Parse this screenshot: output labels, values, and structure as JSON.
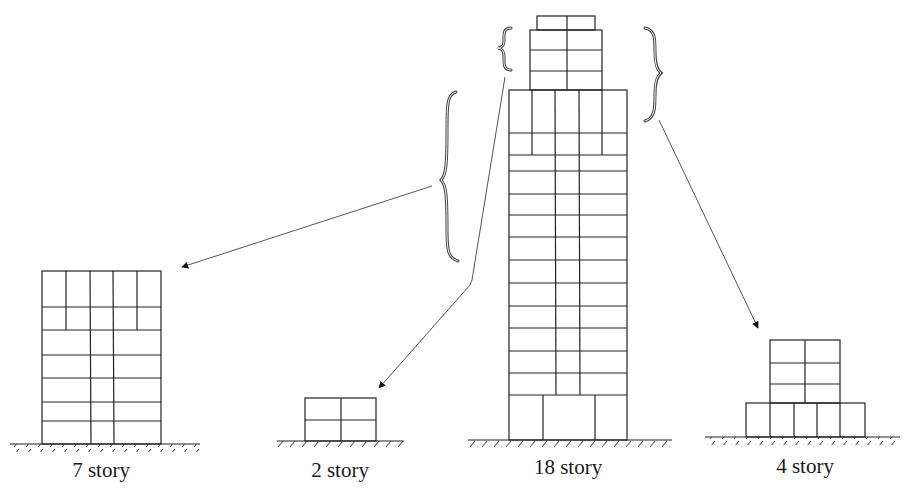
{
  "diagram": {
    "type": "building-decomposition",
    "line_color": "#222222",
    "buildings": [
      {
        "id": "seven-story",
        "label": "7 story",
        "stories": 7,
        "label_pos": [
          101,
          478
        ]
      },
      {
        "id": "two-story",
        "label": "2 story",
        "stories": 2,
        "label_pos": [
          340,
          478
        ]
      },
      {
        "id": "eighteen-story",
        "label": "18 story",
        "stories": 18,
        "label_pos": [
          568,
          475
        ]
      },
      {
        "id": "four-story",
        "label": "4 story",
        "stories": 4,
        "label_pos": [
          805,
          474
        ]
      }
    ],
    "arrows": [
      {
        "from": "left-large-brace",
        "to": "seven-story"
      },
      {
        "from": "top-small-brace",
        "to": "two-story"
      },
      {
        "from": "right-brace",
        "to": "four-story"
      }
    ]
  }
}
